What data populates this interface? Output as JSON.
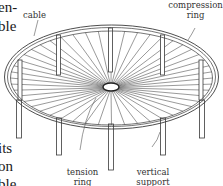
{
  "figure": {
    "type": "technical-illustration",
    "colors": {
      "line": "#3a3a3a",
      "cable": "#555555",
      "background": "#ffffff",
      "text": "#333333"
    },
    "labels": {
      "cable": "cable",
      "compression_ring_1": "compression",
      "compression_ring_2": "ring",
      "tension_ring_1": "tension",
      "tension_ring_2": "ring",
      "vertical_support_1": "vertical",
      "vertical_support_2": "support"
    }
  },
  "body_text_fragments": {
    "line1": "en-",
    "line2": "ble",
    "line3": "its",
    "line4": "on",
    "line5": "ble,"
  }
}
